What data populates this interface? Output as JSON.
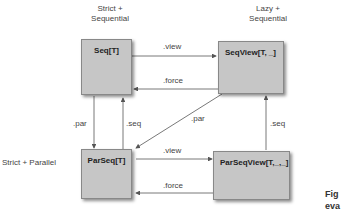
{
  "headers": {
    "strict_sequential": [
      "Strict +",
      "Sequential"
    ],
    "lazy_sequential": [
      "Lazy +",
      "Sequential"
    ],
    "strict_parallel": "Strict + Parallel"
  },
  "nodes": {
    "seq": "Seq[T]",
    "seqview": "SeqView[T, _]",
    "parseq": "ParSeq[T]",
    "parseqview": "ParSeqView[T,_,_]"
  },
  "edges": {
    "seq_to_seqview": ".view",
    "seqview_to_seq": ".force",
    "seq_to_parseq": ".par",
    "parseq_to_seq": ".seq",
    "seqview_to_parseq": ".par",
    "parseqview_to_seqview": ".seq",
    "parseq_to_parseqview": ".view",
    "parseqview_to_parseq": ".force"
  },
  "caption": [
    "Fig",
    "eva"
  ],
  "colors": {
    "box_fill": "#c6c6c6",
    "line": "#555555"
  }
}
